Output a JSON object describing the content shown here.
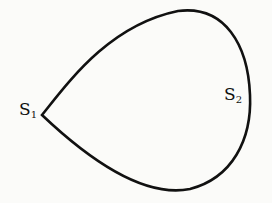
{
  "diagram": {
    "type": "closed-curve",
    "shape": "teardrop / loop with cusp",
    "stroke_color": "#111111",
    "background_color": "#fbfbf9",
    "labels": [
      {
        "id": "s1",
        "base": "S",
        "sub": "1",
        "position": "left cusp"
      },
      {
        "id": "s2",
        "base": "S",
        "sub": "2",
        "position": "right side, inside curve"
      }
    ]
  }
}
